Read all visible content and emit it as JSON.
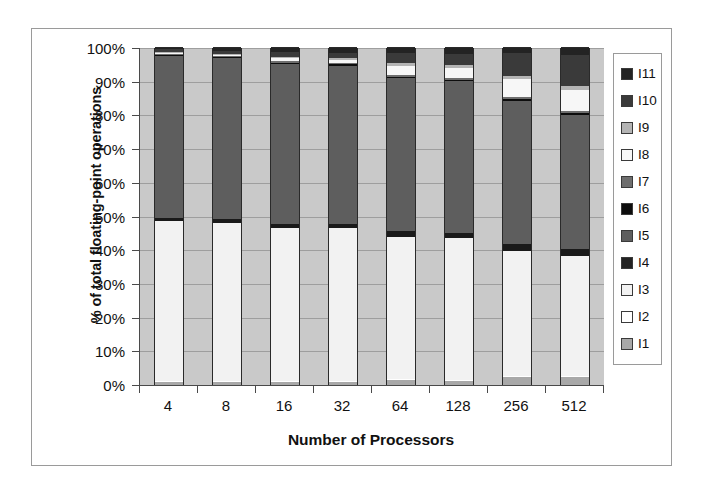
{
  "chart_data": {
    "type": "bar",
    "subtype": "stacked-100-percent",
    "title": "",
    "xlabel": "Number of Processors",
    "ylabel": "% of total floating-point operations",
    "categories": [
      "4",
      "8",
      "16",
      "32",
      "64",
      "128",
      "256",
      "512"
    ],
    "ylim": [
      0,
      100
    ],
    "ytick_labels": [
      "0%",
      "10%",
      "20%",
      "30%",
      "40%",
      "50%",
      "60%",
      "70%",
      "80%",
      "90%",
      "100%"
    ],
    "ytick_values": [
      0,
      10,
      20,
      30,
      40,
      50,
      60,
      70,
      80,
      90,
      100
    ],
    "grid": true,
    "legend_position": "right",
    "legend_order_top_to_bottom": [
      "I11",
      "I10",
      "I9",
      "I8",
      "I7",
      "I6",
      "I5",
      "I4",
      "I3",
      "I2",
      "I1"
    ],
    "series": [
      {
        "name": "I1",
        "color": "#a8a8a8",
        "values": [
          0.8,
          0.8,
          1.0,
          1.0,
          1.4,
          1.2,
          2.3,
          2.4
        ]
      },
      {
        "name": "I2",
        "color": "#ffffff",
        "values": [
          0.3,
          0.3,
          0.3,
          0.3,
          0.3,
          0.3,
          0.4,
          0.4
        ]
      },
      {
        "name": "I3",
        "color": "#f2f2f2",
        "values": [
          47.5,
          47.0,
          45.3,
          45.3,
          42.3,
          42.0,
          37.0,
          35.4
        ]
      },
      {
        "name": "I4",
        "color": "#1a1a1a",
        "values": [
          1.1,
          1.1,
          1.2,
          1.2,
          1.6,
          1.6,
          2.0,
          2.2
        ]
      },
      {
        "name": "I5",
        "color": "#5e5e5e",
        "values": [
          48.0,
          47.8,
          47.5,
          47.0,
          45.4,
          45.0,
          42.5,
          39.7
        ]
      },
      {
        "name": "I6",
        "color": "#0d0d0d",
        "values": [
          0.3,
          0.3,
          0.4,
          0.4,
          0.5,
          0.5,
          0.6,
          0.6
        ]
      },
      {
        "name": "I7",
        "color": "#6e6e6e",
        "values": [
          0.3,
          0.3,
          0.4,
          0.4,
          0.5,
          0.5,
          0.6,
          0.6
        ]
      },
      {
        "name": "I8",
        "color": "#f7f7f7",
        "values": [
          0.2,
          0.3,
          0.8,
          0.9,
          2.8,
          2.9,
          5.4,
          6.1
        ]
      },
      {
        "name": "I9",
        "color": "#b4b4b4",
        "values": [
          0.2,
          0.2,
          0.4,
          0.5,
          0.8,
          0.9,
          1.0,
          1.2
        ]
      },
      {
        "name": "I10",
        "color": "#3a3a3a",
        "values": [
          0.9,
          1.0,
          1.4,
          1.6,
          3.0,
          3.4,
          6.7,
          9.2
        ]
      },
      {
        "name": "I11",
        "color": "#232323",
        "values": [
          0.4,
          0.9,
          1.3,
          1.4,
          1.4,
          1.7,
          1.5,
          2.2
        ]
      }
    ]
  },
  "legend": {
    "items": [
      {
        "label": "I11",
        "color": "#232323"
      },
      {
        "label": "I10",
        "color": "#3a3a3a"
      },
      {
        "label": "I9",
        "color": "#b4b4b4"
      },
      {
        "label": "I8",
        "color": "#f7f7f7"
      },
      {
        "label": "I7",
        "color": "#6e6e6e"
      },
      {
        "label": "I6",
        "color": "#0d0d0d"
      },
      {
        "label": "I5",
        "color": "#5e5e5e"
      },
      {
        "label": "I4",
        "color": "#232323"
      },
      {
        "label": "I3",
        "color": "#f2f2f2"
      },
      {
        "label": "I2",
        "color": "#ffffff"
      },
      {
        "label": "I1",
        "color": "#a8a8a8"
      }
    ]
  },
  "colors": {
    "plot_background": "#c9c9c9",
    "gridline": "#8f8f8f",
    "axis": "#4a4a4a",
    "frame": "#9a9a9a",
    "text": "#111111"
  }
}
